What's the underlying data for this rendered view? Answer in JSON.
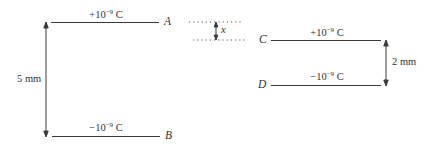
{
  "diagram": {
    "left_capacitor": {
      "top_plate": {
        "label": "A",
        "charge_base": "+10",
        "charge_exp": "−9",
        "charge_unit": " C"
      },
      "bottom_plate": {
        "label": "B",
        "charge_base": "−10",
        "charge_exp": "−9",
        "charge_unit": " C"
      },
      "separation": "5 mm"
    },
    "offset_marker": {
      "label": "x"
    },
    "right_capacitor": {
      "top_plate": {
        "label": "C",
        "charge_base": "+10",
        "charge_exp": "−9",
        "charge_unit": " C"
      },
      "bottom_plate": {
        "label": "D",
        "charge_base": "−10",
        "charge_exp": "−9",
        "charge_unit": " C"
      },
      "separation": "2 mm"
    }
  }
}
